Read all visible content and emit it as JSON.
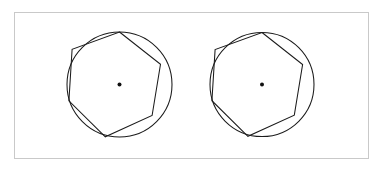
{
  "figure": {
    "background_color": "#ffffff",
    "frame": {
      "name": "outer-border",
      "x": 14,
      "y": 12,
      "width": 355,
      "height": 147,
      "stroke_color": "#c9c9c9",
      "stroke_width": 1,
      "fill_color": "#ffffff"
    },
    "stroke_color": "#1b1b1b",
    "stroke_width": 1.05,
    "dot_color": "#111111",
    "shapes": [
      {
        "id": "left",
        "label": "left-figure",
        "circle": {
          "cx": 119.5,
          "cy": 84.5,
          "r": 52.5
        },
        "polygon": {
          "sides": 7,
          "name": "heptagon",
          "circumradius": 52.5,
          "rotation_deg": -90,
          "vertices": [
            [
              119.5,
              32.0
            ],
            [
              160.5,
              64.3
            ],
            [
              152.1,
              115.5
            ],
            [
              105.3,
              136.8
            ],
            [
              68.9,
              100.9
            ],
            [
              72.1,
              49.3
            ],
            [
              119.5,
              32.0
            ]
          ]
        },
        "center_dot": {
          "cx": 119.5,
          "cy": 84.5,
          "r": 2.0
        }
      },
      {
        "id": "right",
        "label": "right-figure",
        "circle": {
          "cx": 262.0,
          "cy": 84.5,
          "r": 52.0
        },
        "polygon": {
          "sides": 7,
          "name": "heptagon",
          "circumradius": 52.0,
          "rotation_deg": -90,
          "vertices": [
            [
              262.0,
              32.5
            ],
            [
              302.6,
              64.5
            ],
            [
              294.3,
              115.2
            ],
            [
              247.9,
              136.3
            ],
            [
              211.9,
              100.7
            ],
            [
              215.1,
              49.6
            ],
            [
              262.0,
              32.5
            ]
          ]
        },
        "center_dot": {
          "cx": 262.0,
          "cy": 84.5,
          "r": 2.0
        }
      }
    ]
  }
}
